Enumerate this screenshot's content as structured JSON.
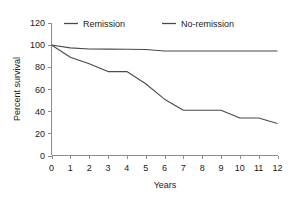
{
  "chart_data": {
    "type": "line",
    "title": "",
    "subtitle": "",
    "xlabel": "Years",
    "ylabel": "Percent survival",
    "xlim": [
      0,
      12
    ],
    "ylim": [
      0,
      120
    ],
    "xticks": [
      "0",
      "1",
      "2",
      "3",
      "4",
      "5",
      "6",
      "7",
      "8",
      "9",
      "10",
      "11",
      "12"
    ],
    "yticks": [
      "0",
      "20",
      "40",
      "60",
      "80",
      "100",
      "120"
    ],
    "grid": false,
    "legend_position": "top-center",
    "line_color": "#4a4a4a",
    "axis_color": "#8c8c8c",
    "x": [
      0,
      1,
      2,
      3,
      4,
      5,
      6,
      7,
      8,
      9,
      10,
      11,
      12
    ],
    "series": [
      {
        "name": "Remission",
        "values": [
          100,
          97.5,
          96.5,
          96.3,
          96.2,
          96.0,
          94.6,
          94.6,
          94.6,
          94.6,
          94.6,
          94.6,
          94.6
        ]
      },
      {
        "name": "No-remission",
        "values": [
          100,
          89,
          83,
          76,
          76,
          65,
          51,
          41,
          41,
          41,
          34,
          34,
          29
        ]
      }
    ]
  },
  "legend": {
    "entries": [
      {
        "label": "Remission",
        "marker": "line-swatch"
      },
      {
        "label": "No-remission",
        "marker": "line-swatch"
      }
    ]
  },
  "axes": {
    "x_title": "Years",
    "y_title": "Percent survival"
  }
}
